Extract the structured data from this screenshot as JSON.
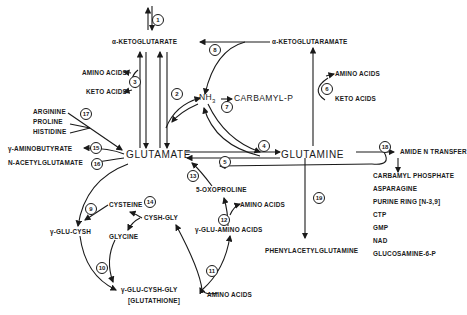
{
  "diagram": {
    "nodes": {
      "akg": "α-KETOGLUTARATE",
      "akgm": "α-KETOGLUTARAMATE",
      "glutamate": "GLUTAMATE",
      "glutamine": "GLUTAMINE",
      "nh3": "NH",
      "nh3_sub": "3",
      "carbamyl_p": "CARBAMYL-P",
      "amino_acids_3": "AMINO ACIDS",
      "keto_acids_3": "KETO ACIDS",
      "amino_acids_6": "AMINO ACIDS",
      "keto_acids_6": "KETO ACIDS",
      "arginine": "ARGININE",
      "proline": "PROLINE",
      "histidine": "HISTIDINE",
      "gaba": "γ-AMINOBUTYRATE",
      "nag": "N-ACETYLGLUTAMATE",
      "amide_n": "AMIDE N TRANSFER",
      "amide_products": [
        "CARBAMYL PHOSPHATE",
        "ASPARAGINE",
        "PURINE RING [N-3,9]",
        "CTP",
        "GMP",
        "NAD",
        "GLUCOSAMINE-6-P"
      ],
      "oxoproline": "5-OXOPROLINE",
      "amino_acids_12": "AMINO ACIDS",
      "glu_amino": "γ-GLU-AMINO ACIDS",
      "cysteine": "CYSTEINE",
      "cysh_gly": "CYSH-GLY",
      "glycine": "GLYCINE",
      "glu_cysh": "γ-GLU-CYSH",
      "glu_cysh_gly": "γ-GLU-CYSH-GLY",
      "glutathione": "[GLUTATHIONE]",
      "amino_acids_11": "AMINO ACIDS",
      "phenylacetyl": "PHENYLACETYLGLUTAMINE"
    },
    "reactions": [
      "1",
      "2",
      "3",
      "4",
      "5",
      "6",
      "7",
      "8",
      "9",
      "10",
      "11",
      "12",
      "13",
      "14",
      "15",
      "16",
      "17",
      "18",
      "19"
    ]
  }
}
